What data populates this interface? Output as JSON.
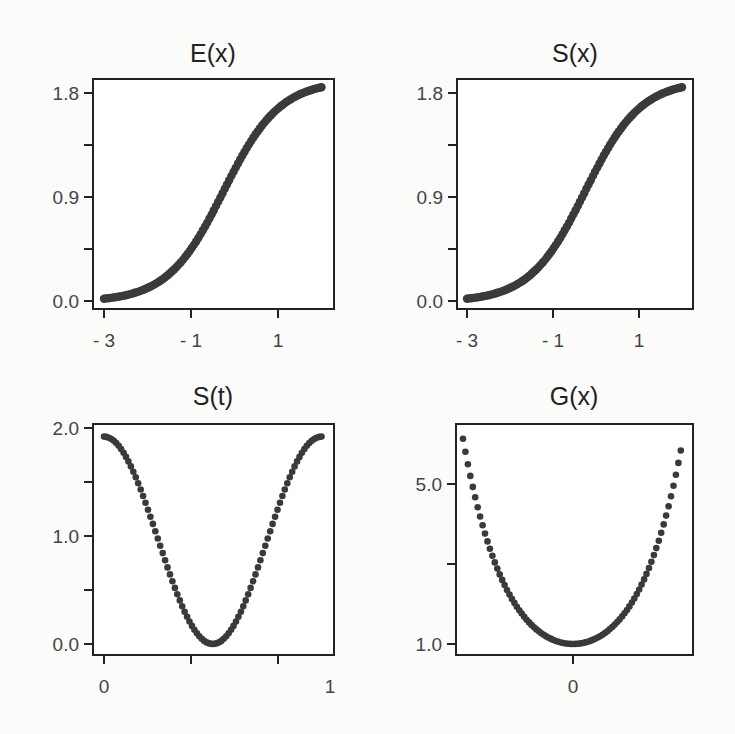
{
  "chart_data": [
    {
      "type": "scatter",
      "title": "E(x)",
      "xlabel": "",
      "ylabel": "",
      "x_range": [
        -3,
        2
      ],
      "ylim": [
        0.0,
        1.8
      ],
      "x_ticks": [
        -3,
        -1,
        1
      ],
      "x_tick_labels": [
        "- 3",
        "- 1",
        "1"
      ],
      "y_ticks": [
        0.0,
        0.45,
        0.9,
        1.35,
        1.8
      ],
      "y_tick_labels": [
        "0.0",
        "",
        "0.9",
        "",
        "1.8"
      ],
      "curve": "sigmoid",
      "n_points": 100,
      "y_start": 0.02,
      "y_end": 1.85,
      "description": "Smooth S-shaped increasing curve from ~0 at x=-3 to ~1.85 at x=2"
    },
    {
      "type": "scatter",
      "title": "S(x)",
      "xlabel": "",
      "ylabel": "",
      "x_range": [
        -3,
        2
      ],
      "ylim": [
        0.0,
        1.8
      ],
      "x_ticks": [
        -3,
        -1,
        1
      ],
      "x_tick_labels": [
        "- 3",
        "- 1",
        "1"
      ],
      "y_ticks": [
        0.0,
        0.45,
        0.9,
        1.35,
        1.8
      ],
      "y_tick_labels": [
        "0.0",
        "",
        "0.9",
        "",
        "1.8"
      ],
      "curve": "sigmoid",
      "n_points": 100,
      "y_start": 0.02,
      "y_end": 1.85,
      "description": "Smooth S-shaped increasing curve from ~0 at x=-3 to ~1.85 at x=2"
    },
    {
      "type": "scatter",
      "title": "S(t)",
      "xlabel": "",
      "ylabel": "",
      "x_range": [
        0,
        1
      ],
      "ylim": [
        0.0,
        2.0
      ],
      "x_ticks": [
        0,
        0.4,
        0.8
      ],
      "x_tick_labels": [
        "0",
        "",
        ""
      ],
      "x_extra_label": "1",
      "y_ticks": [
        0.0,
        0.5,
        1.0,
        1.5,
        2.0
      ],
      "y_tick_labels": [
        "0.0",
        "",
        "1.0",
        "",
        "2.0"
      ],
      "curve": "cosine",
      "n_points": 90,
      "y_max": 1.92,
      "y_min": 0.0,
      "description": "U/V-shaped curve starting at ~1.92 at t=0, dipping to 0 near t=0.5, returning to ~1.92 at t=1"
    },
    {
      "type": "scatter",
      "title": "G(x)",
      "xlabel": "",
      "ylabel": "",
      "x_range": [
        -2.5,
        2.45
      ],
      "ylim": [
        1.0,
        5.0
      ],
      "x_ticks": [
        0
      ],
      "x_tick_labels": [
        "0"
      ],
      "y_ticks": [
        1.0,
        3.0,
        5.0
      ],
      "y_tick_labels": [
        "1.0",
        "",
        "5.0"
      ],
      "curve": "cosh",
      "n_points": 90,
      "y_min": 1.0,
      "y_left_end": 6.1,
      "y_right_end": 5.8,
      "description": "Convex U-shaped dotted curve with minimum 1.0 at x=0, rising to ~6.1 (left) and ~5.8 (right)"
    }
  ]
}
